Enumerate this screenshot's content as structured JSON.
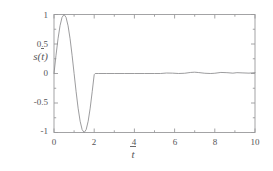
{
  "chart_data": {
    "type": "line",
    "title": "",
    "subtitle": "",
    "xlabel": "t",
    "xlabel_overline": true,
    "ylabel": "s(t)",
    "ylabel_overline": true,
    "xlim": [
      0,
      10
    ],
    "ylim": [
      -1,
      1
    ],
    "xticks": [
      0,
      2,
      4,
      6,
      8,
      10
    ],
    "xticklabels": [
      "0",
      "2",
      "4",
      "6",
      "8",
      "10"
    ],
    "yticks": [
      1,
      0.5,
      0,
      -0.5,
      -1
    ],
    "yticklabels": [
      "1",
      "0.5",
      "0",
      "-0.5",
      "-1"
    ],
    "x_minor_tick_step": 1,
    "y_minor_tick_step": 0.25,
    "grid": false,
    "legend": null,
    "frame": "box",
    "line_color": "#8a8a8c",
    "line_width": 0.8,
    "series": [
      {
        "name": "s(t)",
        "description": "One full sine cycle sin(pi*t) on 0<=t<=2, then ~0 with small ripples",
        "x": [
          0,
          0.1,
          0.2,
          0.3,
          0.4,
          0.5,
          0.6,
          0.7,
          0.8,
          0.9,
          1.0,
          1.1,
          1.2,
          1.3,
          1.4,
          1.5,
          1.6,
          1.7,
          1.8,
          1.9,
          2.0,
          2.05,
          2.2,
          2.6,
          3.0,
          3.5,
          4.0,
          4.5,
          5.0,
          5.3,
          5.6,
          5.9,
          6.2,
          6.5,
          6.8,
          7.0,
          7.2,
          7.5,
          7.8,
          8.0,
          8.3,
          8.6,
          8.9,
          9.1,
          9.4,
          9.7,
          10.0
        ],
        "y": [
          0,
          0.309,
          0.588,
          0.809,
          0.951,
          1.0,
          0.951,
          0.809,
          0.588,
          0.309,
          0,
          -0.309,
          -0.588,
          -0.809,
          -0.951,
          -1.0,
          -0.951,
          -0.809,
          -0.588,
          -0.309,
          -0.02,
          0.0,
          0.0,
          0.0,
          0.0,
          0.0,
          0.0,
          0.0,
          0.0,
          0.0,
          0.008,
          0.006,
          0.0,
          0.004,
          0.018,
          0.022,
          0.016,
          0.004,
          0.0,
          0.004,
          0.018,
          0.014,
          0.006,
          0.014,
          0.01,
          0.006,
          0.014
        ]
      }
    ]
  },
  "axes": {
    "frame_color": "#9a9a9c",
    "background": "#ffffff"
  }
}
